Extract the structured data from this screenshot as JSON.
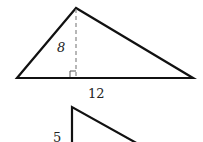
{
  "diagram": {
    "triangle1": {
      "height_label": "8",
      "base_label": "12",
      "has_right_angle_marker": true,
      "altitude_style": "dashed"
    },
    "triangle2": {
      "side_label": "5"
    },
    "colors": {
      "stroke": "#111111",
      "dashed": "#888888",
      "background": "#ffffff"
    }
  }
}
